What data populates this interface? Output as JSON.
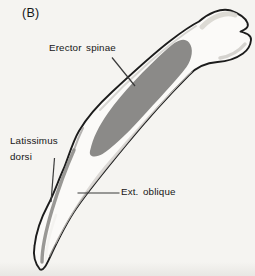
{
  "figure": {
    "panel_label": "(B)",
    "labels": {
      "erector_spinae": "Erector spinae",
      "latissimus_dorsi_line1": "Latissimus",
      "latissimus_dorsi_line2": "dorsi",
      "ext_oblique": "Ext. oblique"
    },
    "colors": {
      "background": "#f5f4f1",
      "bone_fill": "#fbfaf8",
      "bone_outline": "#1c1c1c",
      "muscle_region": "#8b8a88",
      "leader_line": "#3a3a3a",
      "text": "#161616"
    }
  }
}
